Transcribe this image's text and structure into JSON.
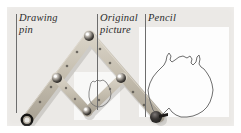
{
  "figure": {
    "kind": "photograph-diagram",
    "background_color": "#ebe9e6",
    "frame_color": "#ffffff"
  },
  "labels": [
    {
      "id": "drawing-pin",
      "text": "Drawing\npin",
      "x": 18,
      "y": 12,
      "leader": {
        "x": 16,
        "y_top": 14,
        "y_bottom": 106
      }
    },
    {
      "id": "original-picture",
      "text": "Original\npicture",
      "x": 99,
      "y": 12,
      "leader": {
        "x": 97,
        "y_top": 14,
        "y_bottom": 103
      }
    },
    {
      "id": "pencil",
      "text": "Pencil",
      "x": 147,
      "y": 12,
      "leader": {
        "x": 145,
        "y_top": 14,
        "y_bottom": 110
      }
    }
  ],
  "mechanism": {
    "arm_color": "#c9c2b4",
    "arm_edge_color": "#9e978a",
    "pivots": [
      {
        "id": "drawing-pin-pivot",
        "x": 20,
        "y": 113,
        "r": 5.2,
        "style": "ring"
      },
      {
        "id": "left-cross-pivot",
        "x": 50,
        "y": 71,
        "r": 5.0,
        "style": "metal-knob"
      },
      {
        "id": "top-pivot",
        "x": 82,
        "y": 29,
        "r": 5.0,
        "style": "metal-knob"
      },
      {
        "id": "right-cross-pivot",
        "x": 114,
        "y": 71,
        "r": 5.0,
        "style": "metal-knob"
      },
      {
        "id": "bottom-pivot",
        "x": 80,
        "y": 104,
        "r": 4.4,
        "style": "metal-knob"
      },
      {
        "id": "pencil-pivot",
        "x": 150,
        "y": 110,
        "r": 6.0,
        "style": "pencil"
      }
    ],
    "arms": [
      {
        "id": "arm-pin-to-top",
        "x1": 20,
        "y1": 113,
        "x2": 83,
        "y2": 29,
        "w": 11
      },
      {
        "id": "arm-top-to-right",
        "x1": 82,
        "y1": 29,
        "x2": 152,
        "y2": 110,
        "w": 11
      },
      {
        "id": "arm-left-to-bottom",
        "x1": 49,
        "y1": 70,
        "x2": 81,
        "y2": 105,
        "w": 9
      },
      {
        "id": "arm-bottom-to-right",
        "x1": 80,
        "y1": 105,
        "x2": 116,
        "y2": 70,
        "w": 9
      }
    ],
    "holes": [
      {
        "x": 33,
        "y": 95
      },
      {
        "x": 44,
        "y": 80
      },
      {
        "x": 60,
        "y": 59
      },
      {
        "x": 70,
        "y": 45
      },
      {
        "x": 93,
        "y": 42
      },
      {
        "x": 103,
        "y": 56
      },
      {
        "x": 126,
        "y": 85
      },
      {
        "x": 137,
        "y": 98
      },
      {
        "x": 59,
        "y": 81
      },
      {
        "x": 68,
        "y": 92
      },
      {
        "x": 92,
        "y": 93
      },
      {
        "x": 103,
        "y": 82
      }
    ]
  },
  "drawings": [
    {
      "id": "original-australia-outline",
      "shape": "Australia",
      "scale": "small",
      "stroke": "#6f6f6f"
    },
    {
      "id": "copied-australia-outline",
      "shape": "Australia",
      "scale": "large",
      "stroke": "#6f6f6f"
    }
  ]
}
